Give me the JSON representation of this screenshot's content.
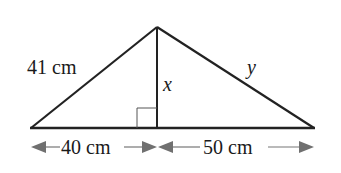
{
  "diagram": {
    "type": "triangle-with-altitude",
    "colors": {
      "stroke": "#222222",
      "arrow": "#707070",
      "background": "#ffffff"
    },
    "labels": {
      "left_side": "41 cm",
      "altitude": "x",
      "right_side": "y",
      "left_base": "40 cm",
      "right_base": "50 cm"
    },
    "right_angle_marker": true
  }
}
